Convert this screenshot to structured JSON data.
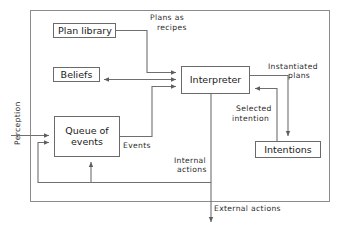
{
  "diagram": {
    "frame": {
      "name": "agent-boundary"
    },
    "nodes": [
      {
        "id": "plan-library",
        "label": "Plan library",
        "x": 53,
        "y": 23,
        "w": 63,
        "h": 15
      },
      {
        "id": "beliefs",
        "label": "Beliefs",
        "x": 53,
        "y": 67,
        "w": 46,
        "h": 15
      },
      {
        "id": "interpreter",
        "label": "Interpreter",
        "x": 181,
        "y": 66,
        "w": 69,
        "h": 28
      },
      {
        "id": "queue-of-events",
        "label": "Queue of\nevents",
        "label_line1": "Queue of",
        "label_line2": "events",
        "x": 54,
        "y": 116,
        "w": 66,
        "h": 41
      },
      {
        "id": "intentions",
        "label": "Intentions",
        "x": 255,
        "y": 141,
        "w": 66,
        "h": 17
      }
    ],
    "edge_labels": [
      {
        "id": "plans-as-recipes",
        "line1": "Plans as",
        "line2": "recipes",
        "x": 150,
        "y": 14
      },
      {
        "id": "instantiated-plans",
        "line1": "Instantiated",
        "line2": "plans",
        "x": 268,
        "y": 62
      },
      {
        "id": "selected-intention",
        "line1": "Selected",
        "line2": "intention",
        "x": 234,
        "y": 104
      },
      {
        "id": "events",
        "line1": "Events",
        "line2": "",
        "x": 123,
        "y": 140
      },
      {
        "id": "internal-actions",
        "line1": "Internal",
        "line2": "actions",
        "x": 172,
        "y": 156
      },
      {
        "id": "external-actions",
        "line1": "External actions",
        "line2": "",
        "x": 214,
        "y": 203
      }
    ],
    "vertical_labels": [
      {
        "id": "perception",
        "label": "Perception",
        "x": 20,
        "y": 145
      }
    ],
    "colors": {
      "background": "#ffffff",
      "box_stroke": "#6a6a6a",
      "frame_stroke": "#8c8c8c",
      "link_stroke": "#6f6f6f",
      "text": "#1a1a1a"
    }
  }
}
